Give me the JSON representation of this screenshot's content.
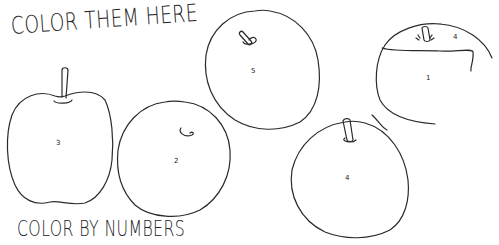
{
  "headings": {
    "top": "COLOR THEM HERE",
    "bottom": "COLOR BY NUMBERS"
  },
  "apples": [
    {
      "id": "apple-left",
      "number": "3",
      "has_stem": true
    },
    {
      "id": "apple-center-left",
      "number": "2",
      "has_stem": false
    },
    {
      "id": "apple-top-center",
      "number": "5",
      "has_stem": true
    },
    {
      "id": "apple-bottom-right",
      "number": "4",
      "has_stem": true
    },
    {
      "id": "apple-far-right",
      "number": "1",
      "top_region_number": "4",
      "has_stem": true
    }
  ],
  "colors": {
    "background": "#ffffff",
    "line": "#2a2a2a"
  }
}
